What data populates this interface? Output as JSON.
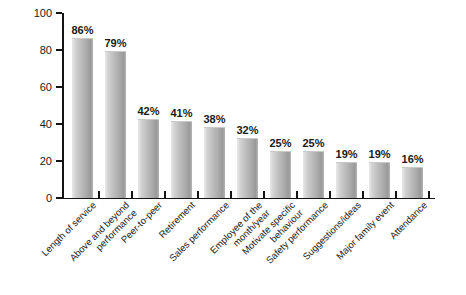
{
  "chart_data": {
    "type": "bar",
    "title": "",
    "subtitle": "",
    "xlabel": "",
    "ylabel": "",
    "ylim": [
      0,
      100
    ],
    "grid": false,
    "legend": false,
    "y_ticks": [
      0,
      20,
      40,
      60,
      80,
      100
    ],
    "y_tick_labels": [
      "0",
      "20",
      "40",
      "60",
      "80",
      "100"
    ],
    "categories": [
      "Length of service",
      "Above and beyond performance",
      "Peer-to-peer",
      "Retirement",
      "Sales performance",
      "Employee of the month/year",
      "Motivate specific behaviour",
      "Safety performance",
      "Suggestions/ideas",
      "Major family event",
      "Attendance"
    ],
    "category_lines": [
      [
        "Length of service"
      ],
      [
        "Above and beyond",
        "performance"
      ],
      [
        "Peer-to-peer"
      ],
      [
        "Retirement"
      ],
      [
        "Sales performance"
      ],
      [
        "Employee of the",
        "month/year"
      ],
      [
        "Motivate specific",
        "behaviour"
      ],
      [
        "Safety performance"
      ],
      [
        "Suggestions/ideas"
      ],
      [
        "Major family event"
      ],
      [
        "Attendance"
      ]
    ],
    "values": [
      86,
      79,
      42,
      41,
      38,
      32,
      25,
      25,
      19,
      19,
      16
    ],
    "value_labels": [
      "86%",
      "79%",
      "42%",
      "41%",
      "38%",
      "32%",
      "25%",
      "25%",
      "19%",
      "19%",
      "16%"
    ],
    "colors": {
      "bar_light": "#e9e9e9",
      "bar_mid": "#bdbdbd",
      "bar_dark": "#9a9a9a",
      "axis": "#141414",
      "text": "#1a1a1a",
      "background": "#ffffff"
    }
  }
}
